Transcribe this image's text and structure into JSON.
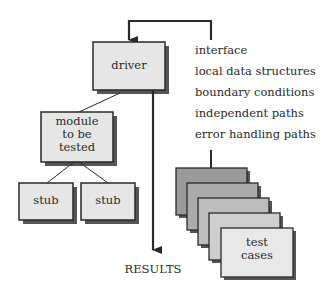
{
  "diagram": {
    "driver": {
      "label": "driver"
    },
    "module": {
      "line1": "module",
      "line2": "to be",
      "line3": "tested"
    },
    "stubs": [
      {
        "label": "stub"
      },
      {
        "label": "stub"
      }
    ],
    "results": {
      "label": "RESULTS"
    },
    "test_cases": {
      "line1": "test",
      "line2": "cases"
    },
    "checklist": [
      "interface",
      "local data structures",
      "boundary conditions",
      "independent paths",
      "error handling paths"
    ],
    "colors": {
      "box_fill": "#e6e6e6",
      "shadow": "#555555",
      "stroke": "#2a2a2a",
      "card_fills": [
        "#9a9a9a",
        "#ababab",
        "#bdbdbd",
        "#cfcfcf",
        "#e8e8e8"
      ]
    }
  }
}
